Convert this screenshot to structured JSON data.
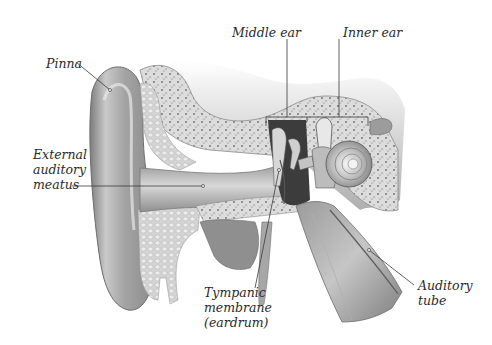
{
  "diagram": {
    "colors": {
      "background": "#ffffff",
      "label_text": "#2a2a2a",
      "leader_line": "#3a3a3a",
      "tissue_dark": "#8a8a8a",
      "tissue_mid": "#b8b8b8",
      "tissue_light": "#e2e2e2",
      "bone": "#d9d9d9",
      "bone_speck": "#6e6e6e"
    },
    "labels": [
      {
        "id": "pinna",
        "lines": [
          "Pinna"
        ],
        "x": 46,
        "y": 56,
        "align": "left",
        "leader": {
          "from": [
            76,
            62
          ],
          "to": [
            110,
            90
          ]
        }
      },
      {
        "id": "external-auditory-meatus",
        "lines": [
          "External",
          "auditory",
          "meatus"
        ],
        "x": 33,
        "y": 147,
        "align": "left",
        "leader": {
          "from": [
            72,
            186
          ],
          "to": [
            203,
            186
          ]
        }
      },
      {
        "id": "middle-ear",
        "lines": [
          "Middle ear"
        ],
        "x": 232,
        "y": 25,
        "align": "left",
        "leader": {
          "from": [
            287,
            39
          ],
          "to": [
            287,
            118
          ]
        },
        "bracket": {
          "x1": 266,
          "x2": 307,
          "y": 117
        }
      },
      {
        "id": "inner-ear",
        "lines": [
          "Inner ear"
        ],
        "x": 343,
        "y": 25,
        "align": "left",
        "leader": {
          "from": [
            339,
            39
          ],
          "to": [
            339,
            118
          ]
        },
        "bracket": {
          "x1": 307,
          "x2": 368,
          "y": 117
        }
      },
      {
        "id": "tympanic-membrane",
        "lines": [
          "Tympanic",
          "membrane",
          "(eardrum)"
        ],
        "x": 204,
        "y": 285,
        "align": "left",
        "leader": {
          "from": [
            255,
            288
          ],
          "to": [
            279,
            170
          ]
        }
      },
      {
        "id": "auditory-tube",
        "lines": [
          "Auditory",
          "tube"
        ],
        "x": 418,
        "y": 278,
        "align": "left",
        "leader": {
          "from": [
            414,
            285
          ],
          "to": [
            369,
            250
          ]
        }
      }
    ]
  }
}
